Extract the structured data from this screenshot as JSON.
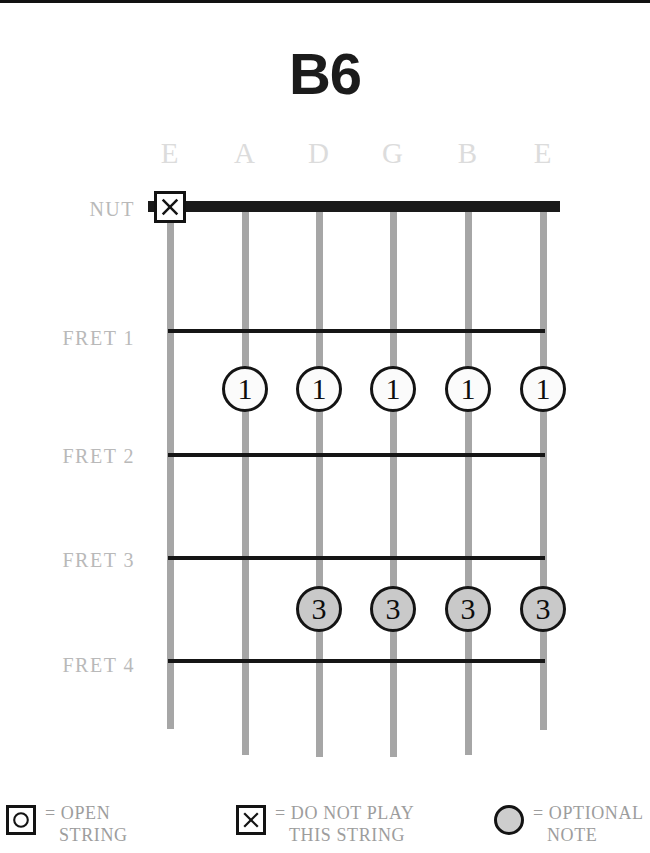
{
  "title": "B6",
  "colors": {
    "string": "#a6a6a6",
    "fret_line": "#151515",
    "nut": "#1a1a1a",
    "label_gray": "#b9b9b9",
    "string_name_gray": "#dcdcdc",
    "optional_fill": "#c9c9c9",
    "finger_fill": "#fbfbfb",
    "legend_text": "#9d9d9d"
  },
  "diagram": {
    "string_names": [
      "E",
      "A",
      "D",
      "G",
      "B",
      "E"
    ],
    "string_x": [
      170,
      245,
      319,
      393,
      468,
      543
    ],
    "string_top": 198,
    "string_bottom": [
      726,
      752,
      754,
      754,
      752,
      727
    ],
    "row_labels": [
      {
        "text": "NUT",
        "y": 196
      },
      {
        "text": "FRET 1",
        "y": 325
      },
      {
        "text": "FRET 2",
        "y": 443
      },
      {
        "text": "FRET 3",
        "y": 547
      },
      {
        "text": "FRET 4",
        "y": 652
      }
    ],
    "fret_lines_y": [
      326,
      450,
      553,
      656
    ],
    "markers": [
      {
        "type": "mute",
        "string": 1,
        "label": "X",
        "x": 170,
        "y": 204
      },
      {
        "type": "finger",
        "string": 2,
        "label": "1",
        "x": 245,
        "y": 386
      },
      {
        "type": "finger",
        "string": 3,
        "label": "1",
        "x": 319,
        "y": 386
      },
      {
        "type": "finger",
        "string": 4,
        "label": "1",
        "x": 393,
        "y": 386
      },
      {
        "type": "finger",
        "string": 5,
        "label": "1",
        "x": 468,
        "y": 386
      },
      {
        "type": "finger",
        "string": 6,
        "label": "1",
        "x": 543,
        "y": 386
      },
      {
        "type": "optional",
        "string": 3,
        "label": "3",
        "x": 319,
        "y": 606
      },
      {
        "type": "optional",
        "string": 4,
        "label": "3",
        "x": 393,
        "y": 606
      },
      {
        "type": "optional",
        "string": 5,
        "label": "3",
        "x": 468,
        "y": 606
      },
      {
        "type": "optional",
        "string": 6,
        "label": "3",
        "x": 543,
        "y": 606
      }
    ]
  },
  "legend": {
    "open": {
      "glyph": "O",
      "line1": "= OPEN",
      "line2": "STRING"
    },
    "mute": {
      "glyph": "X",
      "line1": "= DO NOT PLAY",
      "line2": "THIS STRING"
    },
    "optional": {
      "glyph": "filled-circle",
      "line1": "= OPTIONAL",
      "line2": "NOTE"
    }
  }
}
